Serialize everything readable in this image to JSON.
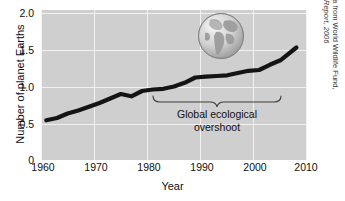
{
  "chart_data": {
    "type": "line",
    "title": "",
    "xlabel": "Year",
    "ylabel": "Number of planet Earths",
    "xlim": [
      1960,
      2010
    ],
    "ylim": [
      0,
      2.0
    ],
    "xticks": [
      1960,
      1970,
      1980,
      1990,
      2000,
      2010
    ],
    "xtick_labels": [
      "1960",
      "1970",
      "1980",
      "1990",
      "2000",
      "2010"
    ],
    "yticks": [
      0,
      0.5,
      1.0,
      1.5,
      2.0
    ],
    "ytick_labels": [
      "0",
      "0.5",
      "1.0",
      "1.5",
      "2.0"
    ],
    "grid": true,
    "legend": "none",
    "series": [
      {
        "name": "Humanity's Ecological Footprint",
        "x": [
          1961,
          1963,
          1965,
          1967,
          1969,
          1971,
          1973,
          1975,
          1977,
          1979,
          1981,
          1983,
          1985,
          1987,
          1989,
          1991,
          1993,
          1995,
          1997,
          1999,
          2001,
          2003,
          2005,
          2008
        ],
        "values": [
          0.53,
          0.56,
          0.62,
          0.66,
          0.71,
          0.76,
          0.82,
          0.88,
          0.85,
          0.92,
          0.94,
          0.95,
          0.98,
          1.03,
          1.1,
          1.11,
          1.12,
          1.13,
          1.16,
          1.19,
          1.2,
          1.27,
          1.33,
          1.5
        ]
      }
    ],
    "annotations": [
      {
        "name": "overshoot-bracket",
        "text": "Global ecological\novershoot",
        "line1": "Global ecological",
        "line2": "overshoot",
        "x_start": 1987,
        "x_end": 2010
      }
    ],
    "colors": {
      "plot_background": "#cfcfcf",
      "gridline": "#f2f2f2",
      "data_line": "#141414",
      "text": "#0f0f0f",
      "credit_text": "#3a3a3a"
    }
  },
  "axes": {
    "y_title": "Number of planet Earths",
    "x_title": "Year"
  },
  "annotation": {
    "line1": "Global ecological",
    "line2": "overshoot"
  },
  "source_credit": {
    "line1": "Based on data from World Wildlife Fund,",
    "line2": "Living Planet Report, 2006"
  },
  "globe": {
    "label": "earth-globe-americas"
  }
}
